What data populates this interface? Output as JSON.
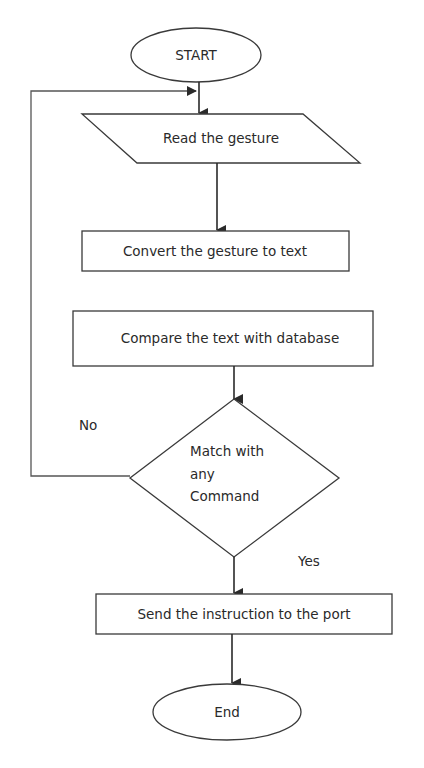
{
  "diagram": {
    "type": "flowchart",
    "colors": {
      "stroke": "#3a3a3a",
      "text": "#2a2a2a",
      "background": "#ffffff"
    },
    "nodes": {
      "start": {
        "shape": "ellipse",
        "label": "START"
      },
      "read": {
        "shape": "parallelogram",
        "label": "Read the gesture"
      },
      "convert": {
        "shape": "rectangle",
        "label": "Convert the gesture to text"
      },
      "compare": {
        "shape": "rectangle",
        "label": "Compare the text with database"
      },
      "decision": {
        "shape": "diamond",
        "line1": "Match with",
        "line2": "any",
        "line3": "Command"
      },
      "send": {
        "shape": "rectangle",
        "label": "Send the instruction to the port"
      },
      "end": {
        "shape": "ellipse",
        "label": "End"
      }
    },
    "edges": {
      "no_label": "No",
      "yes_label": "Yes"
    }
  }
}
